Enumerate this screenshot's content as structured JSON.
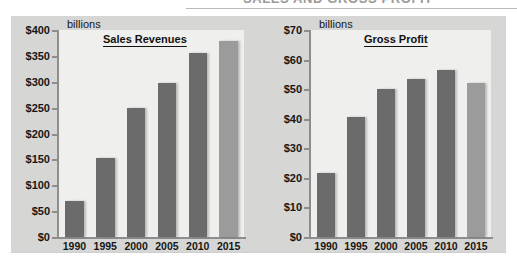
{
  "running_head": "SALES AND GROSS PROFIT",
  "charts": [
    {
      "key": "sales",
      "title": "Sales Revenues",
      "units": "billions",
      "highlight_color": "#9b9b9b",
      "bar_color": "#6b6b6b"
    },
    {
      "key": "profit",
      "title": "Gross Profit",
      "units": "billions",
      "highlight_color": "#9b9b9b",
      "bar_color": "#6b6b6b"
    }
  ],
  "chart_data": [
    {
      "type": "bar",
      "title": "Sales Revenues",
      "xlabel": "",
      "ylabel": "billions",
      "categories": [
        "1990",
        "1995",
        "2000",
        "2005",
        "2010",
        "2015"
      ],
      "values": [
        70,
        153,
        249,
        297,
        355,
        379
      ],
      "ylim": [
        0,
        400
      ],
      "ytick_values": [
        0,
        50,
        100,
        150,
        200,
        250,
        300,
        350,
        400
      ],
      "ytick_labels": [
        "$0",
        "$50",
        "$100",
        "$150",
        "$200",
        "$250",
        "$300",
        "$350",
        "$400"
      ],
      "grid": false,
      "legend": "none",
      "highlight_category": "2015"
    },
    {
      "type": "bar",
      "title": "Gross Profit",
      "xlabel": "",
      "ylabel": "billions",
      "categories": [
        "1990",
        "1995",
        "2000",
        "2005",
        "2010",
        "2015"
      ],
      "values": [
        21.5,
        40.5,
        50,
        53.5,
        56.5,
        52
      ],
      "ylim": [
        0,
        70
      ],
      "ytick_values": [
        0,
        10,
        20,
        30,
        40,
        50,
        60,
        70
      ],
      "ytick_labels": [
        "$0",
        "$10",
        "$20",
        "$30",
        "$40",
        "$50",
        "$60",
        "$70"
      ],
      "grid": false,
      "legend": "none",
      "highlight_category": "2015"
    }
  ]
}
